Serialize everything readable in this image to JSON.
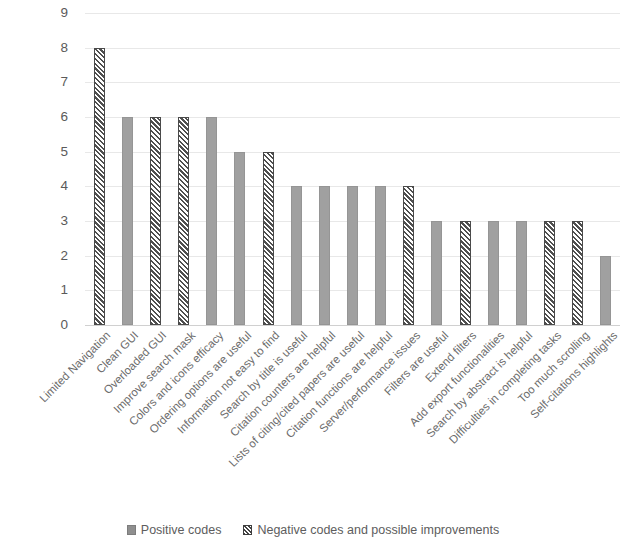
{
  "chart_data": {
    "type": "bar",
    "title": "",
    "subtitle": "",
    "xlabel": "",
    "ylabel": "",
    "ylim": [
      0,
      9
    ],
    "y_ticks": [
      0,
      1,
      2,
      3,
      4,
      5,
      6,
      7,
      8,
      9
    ],
    "grid": true,
    "legend_position": "bottom",
    "categories": [
      "Limited Navigation",
      "Clean GUI",
      "Overloaded GUI",
      "Improve search mask",
      "Colors and icons efficacy",
      "Ordering options are useful",
      "Information not easy to find",
      "Search by title is useful",
      "Citation counters are helpful",
      "Lists of citing/cited papers are useful",
      "Citation functions are helpful",
      "Server/performance issues",
      "Filters are useful",
      "Extend filters",
      "Add export functionalities",
      "Search by abstract is helpful",
      "Difficulties in completing tasks",
      "Too much scrolling",
      "Self-citations highlights"
    ],
    "values": [
      8,
      6,
      6,
      6,
      6,
      5,
      5,
      4,
      4,
      4,
      4,
      4,
      3,
      3,
      3,
      3,
      3,
      3,
      2
    ],
    "series": [
      {
        "name": "Positive codes",
        "pattern": "solid",
        "color": "#a0a0a0",
        "points": [
          {
            "category": "Clean GUI",
            "value": 6
          },
          {
            "category": "Colors and icons efficacy",
            "value": 6
          },
          {
            "category": "Ordering options are useful",
            "value": 5
          },
          {
            "category": "Search by title is useful",
            "value": 4
          },
          {
            "category": "Citation counters are helpful",
            "value": 4
          },
          {
            "category": "Lists of citing/cited papers are useful",
            "value": 4
          },
          {
            "category": "Citation functions are helpful",
            "value": 4
          },
          {
            "category": "Filters are useful",
            "value": 3
          },
          {
            "category": "Add export functionalities",
            "value": 3
          },
          {
            "category": "Search by abstract is helpful",
            "value": 3
          },
          {
            "category": "Self-citations highlights",
            "value": 2
          }
        ]
      },
      {
        "name": "Negative codes and possible improvements",
        "pattern": "diagonal-hatch",
        "color": "#4f4f4f",
        "points": [
          {
            "category": "Limited Navigation",
            "value": 8
          },
          {
            "category": "Overloaded GUI",
            "value": 6
          },
          {
            "category": "Improve search mask",
            "value": 6
          },
          {
            "category": "Information not easy to find",
            "value": 5
          },
          {
            "category": "Server/performance issues",
            "value": 4
          },
          {
            "category": "Extend filters",
            "value": 3
          },
          {
            "category": "Difficulties in completing tasks",
            "value": 3
          },
          {
            "category": "Too much scrolling",
            "value": 3
          }
        ]
      }
    ],
    "bars": [
      {
        "label": "Limited Navigation",
        "value": 8,
        "series": "negative"
      },
      {
        "label": "Clean GUI",
        "value": 6,
        "series": "positive"
      },
      {
        "label": "Overloaded GUI",
        "value": 6,
        "series": "negative"
      },
      {
        "label": "Improve search mask",
        "value": 6,
        "series": "negative"
      },
      {
        "label": "Colors and icons efficacy",
        "value": 6,
        "series": "positive"
      },
      {
        "label": "Ordering options are useful",
        "value": 5,
        "series": "positive"
      },
      {
        "label": "Information not easy to find",
        "value": 5,
        "series": "negative"
      },
      {
        "label": "Search by title is useful",
        "value": 4,
        "series": "positive"
      },
      {
        "label": "Citation counters are helpful",
        "value": 4,
        "series": "positive"
      },
      {
        "label": "Lists of citing/cited papers are useful",
        "value": 4,
        "series": "positive"
      },
      {
        "label": "Citation functions are helpful",
        "value": 4,
        "series": "positive"
      },
      {
        "label": "Server/performance issues",
        "value": 4,
        "series": "negative"
      },
      {
        "label": "Filters are useful",
        "value": 3,
        "series": "positive"
      },
      {
        "label": "Extend filters",
        "value": 3,
        "series": "negative"
      },
      {
        "label": "Add export functionalities",
        "value": 3,
        "series": "positive"
      },
      {
        "label": "Search by abstract is helpful",
        "value": 3,
        "series": "positive"
      },
      {
        "label": "Difficulties in completing tasks",
        "value": 3,
        "series": "negative"
      },
      {
        "label": "Too much scrolling",
        "value": 3,
        "series": "negative"
      },
      {
        "label": "Self-citations highlights",
        "value": 2,
        "series": "positive"
      }
    ]
  },
  "legend": {
    "items": [
      {
        "label": "Positive codes",
        "pattern": "solid"
      },
      {
        "label": "Negative codes and possible improvements",
        "pattern": "diagonal-hatch"
      }
    ]
  },
  "colors": {
    "positive_bar": "#a0a0a0",
    "negative_hatch": "#4f4f4f",
    "gridline": "#e8e8e8",
    "axis_text": "#5a5a5a",
    "label_text": "#6b6b6b",
    "background": "#ffffff"
  }
}
